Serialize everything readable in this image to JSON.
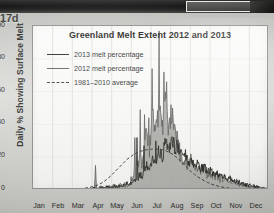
{
  "overlay": {
    "crop_label": "17d"
  },
  "chart_data": {
    "type": "line",
    "title": "Greenland Melt Extent 2012 and 2013",
    "xlabel": "",
    "ylabel": "Daily % Showing Surface Melt",
    "ylim": [
      0,
      100
    ],
    "yticks": [
      0,
      20,
      40,
      60,
      80,
      100
    ],
    "xticks": [
      "Jan",
      "Feb",
      "Mar",
      "Apr",
      "May",
      "Jun",
      "Jul",
      "Aug",
      "Sep",
      "Oct",
      "Nov",
      "Dec"
    ],
    "grid": "vertical",
    "legend_position": "upper-left",
    "legend": [
      {
        "label": "2013 melt percentage",
        "style": "solid",
        "color": "#23231f"
      },
      {
        "label": "2012 melt percentage",
        "style": "solid",
        "color": "#5b5b57"
      },
      {
        "label": "1981–2010 average",
        "style": "dashed",
        "color": "#3a3a36"
      }
    ],
    "x": [
      0,
      5,
      10,
      15,
      20,
      25,
      30,
      35,
      40,
      45,
      50,
      55,
      60,
      65,
      70,
      75,
      80,
      85,
      90,
      95,
      100,
      105,
      110,
      115,
      120,
      125,
      130,
      135,
      140,
      145,
      150,
      155,
      160,
      165,
      170,
      175,
      180,
      185,
      190,
      195,
      200,
      205,
      210,
      215,
      220,
      225,
      230,
      235,
      240,
      245,
      250,
      255,
      260,
      265,
      270,
      275,
      280,
      285,
      290,
      295,
      300,
      305,
      310,
      315,
      320,
      325,
      330,
      335,
      340,
      345,
      350,
      355,
      360,
      364
    ],
    "series": [
      {
        "name": "2013 melt percentage",
        "color": "#23231f",
        "style": "solid",
        "values": [
          0.4,
          0.3,
          0.5,
          0.4,
          0.3,
          0.6,
          0.4,
          0.3,
          0.5,
          0.4,
          0.6,
          0.5,
          0.8,
          0.6,
          0.5,
          0.7,
          0.6,
          1.0,
          0.8,
          1.2,
          0.9,
          1.5,
          1.2,
          2.0,
          1.6,
          2.4,
          2.0,
          3.2,
          2.6,
          4.0,
          3.4,
          6.0,
          4.6,
          8.0,
          6.4,
          12.0,
          9.0,
          14.0,
          11.0,
          17.0,
          13.0,
          20.0,
          16.0,
          23.0,
          19.0,
          22.0,
          18.0,
          21.0,
          17.0,
          19.0,
          15.0,
          17.0,
          13.0,
          14.0,
          11.0,
          12.0,
          9.0,
          10.0,
          8.0,
          8.5,
          6.5,
          7.0,
          5.0,
          5.5,
          4.0,
          4.2,
          3.2,
          3.0,
          2.4,
          2.2,
          1.6,
          1.4,
          1.0,
          0.8
        ]
      },
      {
        "name": "2012 melt percentage",
        "color": "#5b5b57",
        "style": "solid",
        "fill": "#9a9a96",
        "values": [
          0.3,
          0.2,
          0.4,
          0.3,
          0.2,
          0.4,
          0.3,
          0.2,
          0.4,
          0.3,
          0.5,
          0.4,
          0.6,
          0.5,
          0.4,
          0.6,
          0.5,
          0.8,
          0.6,
          1.0,
          0.8,
          1.4,
          1.0,
          1.8,
          1.4,
          2.2,
          1.8,
          3.0,
          2.4,
          3.8,
          3.0,
          5.5,
          4.2,
          7.5,
          6.0,
          11.0,
          8.5,
          13.0,
          10.5,
          16.0,
          12.5,
          19.0,
          15.0,
          22.0,
          18.0,
          21.0,
          17.0,
          20.0,
          16.0,
          18.0,
          14.0,
          16.0,
          12.0,
          13.0,
          10.0,
          11.0,
          8.0,
          9.0,
          7.0,
          7.5,
          5.5,
          6.0,
          4.5,
          5.0,
          3.6,
          3.8,
          2.8,
          2.6,
          2.0,
          1.8,
          1.4,
          1.2,
          0.9,
          0.7
        ]
      },
      {
        "name": "1981–2010 average",
        "color": "#3a3a36",
        "style": "dashed",
        "values": [
          0.2,
          0.2,
          0.2,
          0.2,
          0.2,
          0.3,
          0.3,
          0.3,
          0.3,
          0.4,
          0.4,
          0.5,
          0.5,
          0.6,
          0.7,
          0.9,
          1.1,
          1.4,
          1.8,
          2.3,
          3.0,
          4.0,
          5.2,
          6.8,
          8.5,
          10.5,
          12.5,
          14.5,
          16.5,
          18.5,
          20.0,
          21.5,
          22.5,
          23.5,
          24.0,
          24.5,
          24.8,
          25.0,
          25.0,
          24.8,
          24.5,
          24.0,
          23.0,
          22.0,
          20.5,
          19.0,
          17.0,
          15.0,
          13.0,
          11.0,
          9.5,
          8.0,
          6.8,
          5.6,
          4.6,
          3.8,
          3.0,
          2.5,
          2.0,
          1.6,
          1.3,
          1.0,
          0.9,
          0.7,
          0.6,
          0.5,
          0.4,
          0.4,
          0.3,
          0.3,
          0.3,
          0.2,
          0.2,
          0.2
        ]
      }
    ],
    "notes": {
      "peak_2012_value": 97,
      "peak_2012_month": "Jul",
      "spring_spike_2012_value": 15,
      "spring_spike_2012_month": "Apr"
    }
  }
}
